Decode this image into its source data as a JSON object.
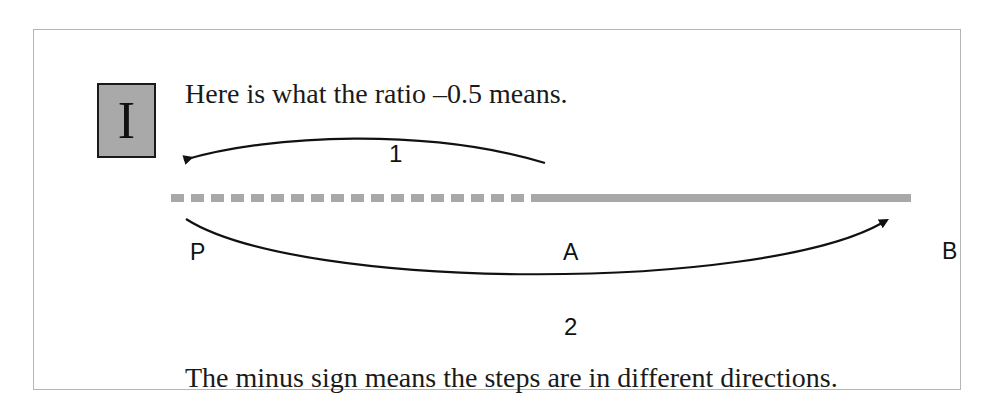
{
  "figure": {
    "badge_label": "I",
    "caption_top": "Here is what the ratio –0.5 means.",
    "caption_bottom": "The minus sign means the steps are in different directions.",
    "points": {
      "p_label": "P",
      "a_label": "A",
      "b_label": "B"
    },
    "steps": {
      "top_label": "1",
      "bottom_label": "2"
    },
    "colors": {
      "badge_fill": "#a9a9a9",
      "badge_border": "#1a1a1a",
      "number_line_gray": "#a8a8a8",
      "arrow_black": "#111111",
      "frame_border": "#b5b5b5",
      "text": "#1a1a1a",
      "background": "#ffffff"
    },
    "number_line": {
      "dashed_segment": "P to A",
      "solid_segment": "A to B"
    }
  }
}
